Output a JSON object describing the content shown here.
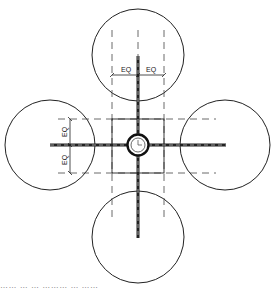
{
  "diagram": {
    "type": "technical-drawing",
    "colors": {
      "line": "#222222",
      "dashed": "#444444",
      "background": "#ffffff"
    },
    "center": {
      "x": 138,
      "y": 145,
      "ring_radius": 10,
      "inner_radius": 7
    },
    "frame": {
      "x": 112,
      "y": 119,
      "width": 52,
      "height": 54
    },
    "circles": [
      {
        "name": "top",
        "cx": 138,
        "cy": 55,
        "r": 46
      },
      {
        "name": "left",
        "cx": 50,
        "cy": 145,
        "r": 45
      },
      {
        "name": "right",
        "cx": 225,
        "cy": 145,
        "r": 45
      },
      {
        "name": "bottom",
        "cx": 138,
        "cy": 237,
        "r": 46
      }
    ],
    "dimensions": {
      "top": {
        "labels": [
          "EQ",
          "EQ"
        ],
        "y": 75,
        "x1": 112,
        "x2": 164
      },
      "left": {
        "labels": [
          "EQ",
          "EQ"
        ],
        "x": 70,
        "y1": 119,
        "y2": 173
      }
    },
    "caption": "…… … …  ……… … ……"
  }
}
